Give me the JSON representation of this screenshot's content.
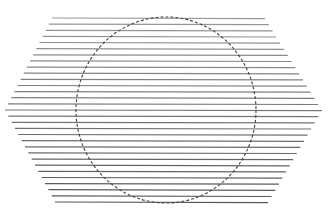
{
  "figure": {
    "type": "optical-illusion",
    "background": "#ffffff",
    "line_color": "#555555",
    "circle_color": "#444444",
    "width": 335,
    "height": 222
  },
  "hexagon": {
    "top_y": 18,
    "bottom_y": 202,
    "mid_y": 110,
    "top_left_x": 52,
    "top_right_x": 265,
    "mid_left_x": 5,
    "mid_right_x": 322,
    "bottom_left_x": 55,
    "bottom_right_x": 268,
    "line_count": 31
  },
  "circle": {
    "cx": 166,
    "cy": 110,
    "rx": 90,
    "ry": 93,
    "dash": "3 2"
  }
}
